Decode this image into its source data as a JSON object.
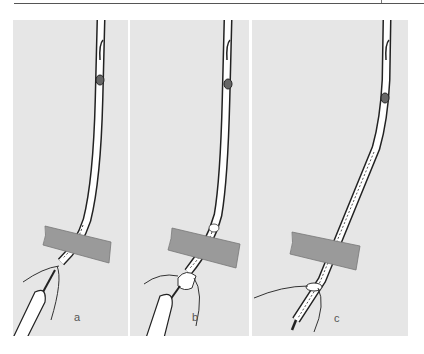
{
  "figure": {
    "panels": [
      {
        "id": "a",
        "label": "a"
      },
      {
        "id": "b",
        "label": "b"
      },
      {
        "id": "c",
        "label": "c"
      }
    ],
    "colors": {
      "background": "#e6e6e6",
      "band": "#9a9a9a",
      "outline": "#222222",
      "tube_fill": "#ffffff"
    }
  }
}
